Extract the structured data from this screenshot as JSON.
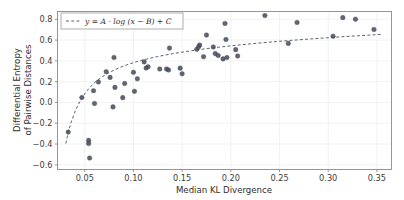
{
  "chart_data": {
    "type": "scatter",
    "title": "",
    "xlabel": "Median KL Divergence",
    "ylabel_line1": "Differential Entropy",
    "ylabel_line2": "of Pairwise Distances",
    "xlim": [
      0.022,
      0.365
    ],
    "ylim": [
      -0.645,
      0.875
    ],
    "xticks": [
      0.05,
      0.1,
      0.15,
      0.2,
      0.25,
      0.3,
      0.35
    ],
    "xticklabels": [
      "0.05",
      "0.10",
      "0.15",
      "0.20",
      "0.25",
      "0.30",
      "0.35"
    ],
    "yticks": [
      -0.6,
      -0.4,
      -0.2,
      0.0,
      0.2,
      0.4,
      0.6,
      0.8
    ],
    "yticklabels": [
      "−0.6",
      "−0.4",
      "−0.2",
      "0.0",
      "0.2",
      "0.4",
      "0.6",
      "0.8"
    ],
    "grid": true,
    "legend_position": "upper-left",
    "legend": [
      {
        "label": "y = A · log (x − B) + C",
        "style": "dashed-line",
        "color": "#4a5060"
      }
    ],
    "marker_color": "#4a5060",
    "series": [
      {
        "name": "datasets",
        "type": "scatter",
        "points": [
          [
            0.033,
            -0.285
          ],
          [
            0.047,
            0.047
          ],
          [
            0.054,
            -0.365
          ],
          [
            0.054,
            -0.395
          ],
          [
            0.055,
            -0.535
          ],
          [
            0.059,
            0.113
          ],
          [
            0.06,
            -0.01
          ],
          [
            0.064,
            0.197
          ],
          [
            0.072,
            0.296
          ],
          [
            0.076,
            0.241
          ],
          [
            0.079,
            -0.043
          ],
          [
            0.08,
            0.433
          ],
          [
            0.081,
            0.145
          ],
          [
            0.089,
            0.046
          ],
          [
            0.091,
            0.182
          ],
          [
            0.1,
            0.29
          ],
          [
            0.101,
            0.107
          ],
          [
            0.104,
            0.228
          ],
          [
            0.111,
            0.39
          ],
          [
            0.113,
            0.331
          ],
          [
            0.115,
            0.343
          ],
          [
            0.127,
            0.322
          ],
          [
            0.134,
            0.322
          ],
          [
            0.136,
            0.312
          ],
          [
            0.137,
            0.523
          ],
          [
            0.148,
            0.33
          ],
          [
            0.15,
            0.276
          ],
          [
            0.165,
            0.512
          ],
          [
            0.167,
            0.537
          ],
          [
            0.168,
            0.552
          ],
          [
            0.172,
            0.44
          ],
          [
            0.175,
            0.648
          ],
          [
            0.182,
            0.534
          ],
          [
            0.184,
            0.47
          ],
          [
            0.187,
            0.452
          ],
          [
            0.192,
            0.419
          ],
          [
            0.194,
            0.76
          ],
          [
            0.195,
            0.606
          ],
          [
            0.196,
            0.432
          ],
          [
            0.205,
            0.508
          ],
          [
            0.207,
            0.447
          ],
          [
            0.235,
            0.836
          ],
          [
            0.259,
            0.568
          ],
          [
            0.268,
            0.769
          ],
          [
            0.305,
            0.637
          ],
          [
            0.315,
            0.816
          ],
          [
            0.328,
            0.801
          ],
          [
            0.347,
            0.702
          ]
        ]
      }
    ],
    "fit_curve": {
      "name": "logarithmic fit",
      "equation": "y = A · log (x − B) + C",
      "style": "dashed",
      "points": [
        [
          0.0305,
          -0.395
        ],
        [
          0.033,
          -0.29
        ],
        [
          0.036,
          -0.19
        ],
        [
          0.0395,
          -0.1
        ],
        [
          0.043,
          -0.025
        ],
        [
          0.047,
          0.042
        ],
        [
          0.051,
          0.098
        ],
        [
          0.056,
          0.152
        ],
        [
          0.061,
          0.198
        ],
        [
          0.067,
          0.241
        ],
        [
          0.073,
          0.277
        ],
        [
          0.08,
          0.311
        ],
        [
          0.088,
          0.344
        ],
        [
          0.096,
          0.371
        ],
        [
          0.105,
          0.397
        ],
        [
          0.115,
          0.421
        ],
        [
          0.125,
          0.442
        ],
        [
          0.136,
          0.462
        ],
        [
          0.148,
          0.481
        ],
        [
          0.16,
          0.498
        ],
        [
          0.173,
          0.515
        ],
        [
          0.187,
          0.531
        ],
        [
          0.201,
          0.546
        ],
        [
          0.216,
          0.56
        ],
        [
          0.231,
          0.573
        ],
        [
          0.247,
          0.586
        ],
        [
          0.263,
          0.598
        ],
        [
          0.28,
          0.61
        ],
        [
          0.297,
          0.621
        ],
        [
          0.314,
          0.632
        ],
        [
          0.331,
          0.642
        ],
        [
          0.348,
          0.651
        ],
        [
          0.356,
          0.656
        ]
      ]
    }
  }
}
